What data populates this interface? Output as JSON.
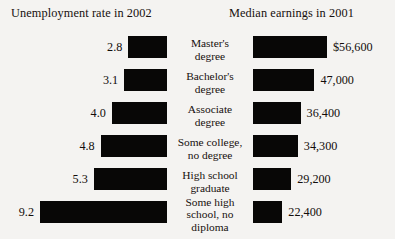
{
  "figure": {
    "left_title": "Unemployment rate in 2002",
    "right_title": "Median earnings in 2001"
  },
  "categories": [
    {
      "line1": "Master's",
      "line2": "degree",
      "line3": ""
    },
    {
      "line1": "Bachelor's",
      "line2": "degree",
      "line3": ""
    },
    {
      "line1": "Associate",
      "line2": "degree",
      "line3": ""
    },
    {
      "line1": "Some college,",
      "line2": "no degree",
      "line3": ""
    },
    {
      "line1": "High school",
      "line2": "graduate",
      "line3": ""
    },
    {
      "line1": "Some high",
      "line2": "school, no",
      "line3": "diploma"
    }
  ],
  "unemployment_labels": [
    "2.8",
    "3.1",
    "4.0",
    "4.8",
    "5.3",
    "9.2"
  ],
  "earnings_labels": [
    "$56,600",
    "47,000",
    "36,400",
    "34,300",
    "29,200",
    "22,400"
  ],
  "chart_data": [
    {
      "type": "bar",
      "title": "Unemployment rate in 2002",
      "orientation": "horizontal",
      "direction": "right-to-left",
      "xlabel": "",
      "ylabel": "",
      "categories": [
        "Master's degree",
        "Bachelor's degree",
        "Associate degree",
        "Some college, no degree",
        "High school graduate",
        "Some high school, no diploma"
      ],
      "values": [
        2.8,
        3.1,
        4.0,
        4.8,
        5.3,
        9.2
      ],
      "value_labels": [
        "2.8",
        "3.1",
        "4.0",
        "4.8",
        "5.3",
        "9.2"
      ],
      "units": "percent",
      "xlim": [
        0,
        9.2
      ],
      "grid": false,
      "legend": false
    },
    {
      "type": "bar",
      "title": "Median earnings in 2001",
      "orientation": "horizontal",
      "direction": "left-to-right",
      "xlabel": "",
      "ylabel": "",
      "categories": [
        "Master's degree",
        "Bachelor's degree",
        "Associate degree",
        "Some college, no degree",
        "High school graduate",
        "Some high school, no diploma"
      ],
      "values": [
        56600,
        47000,
        36400,
        34300,
        29200,
        22400
      ],
      "value_labels": [
        "$56,600",
        "47,000",
        "36,400",
        "34,300",
        "29,200",
        "22,400"
      ],
      "units": "US dollars",
      "xlim": [
        0,
        56600
      ],
      "grid": false,
      "legend": false
    }
  ],
  "style": {
    "bar_color": "#080706",
    "background": "#f4f3f1",
    "text_color": "#17100e"
  }
}
